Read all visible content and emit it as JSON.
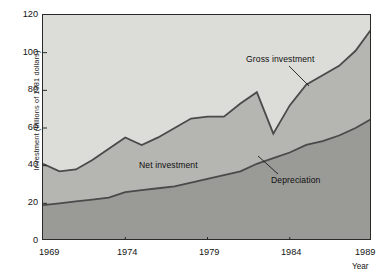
{
  "chart_data": {
    "type": "area",
    "title": "",
    "xlabel": "Year",
    "ylabel": "Investment (billions of 1981 dollars)",
    "xlim": [
      1969,
      1989
    ],
    "ylim": [
      0,
      120
    ],
    "grid": false,
    "legend_position": "inline-annotations",
    "x_tick_labels": [
      "1969",
      "1974",
      "1979",
      "1984",
      "1989"
    ],
    "x_ticks": [
      1969,
      1974,
      1979,
      1984,
      1989
    ],
    "y_tick_labels": [
      "0",
      "20",
      "40",
      "60",
      "80",
      "100",
      "120"
    ],
    "y_ticks": [
      0,
      20,
      40,
      60,
      80,
      100,
      120
    ],
    "x": [
      1969,
      1970,
      1971,
      1972,
      1973,
      1974,
      1975,
      1976,
      1977,
      1978,
      1979,
      1980,
      1981,
      1982,
      1983,
      1984,
      1985,
      1986,
      1987,
      1988,
      1989
    ],
    "series": [
      {
        "name": "Gross investment",
        "values": [
          41,
          37,
          38,
          43,
          49,
          55,
          51,
          55,
          60,
          65,
          66,
          66,
          73,
          79,
          57,
          72,
          83,
          88,
          93,
          101,
          113
        ]
      },
      {
        "name": "Depreciation",
        "values": [
          19,
          20,
          21,
          22,
          23,
          26,
          27,
          28,
          29,
          31,
          33,
          35,
          37,
          41,
          44,
          47,
          51,
          53,
          56,
          60,
          65
        ]
      }
    ],
    "annotations": [
      {
        "text": "Gross investment",
        "band": "upper-boundary"
      },
      {
        "text": "Net investment",
        "band": "middle-band"
      },
      {
        "text": "Depreciation",
        "band": "lower-boundary"
      }
    ],
    "colors": {
      "background_above": "#dcdcd8",
      "net_investment_band": "#b5b5b1",
      "depreciation_band": "#9a9a96",
      "line": "#4a4a4a",
      "axis": "#2a2a2a",
      "text": "#141414"
    }
  }
}
